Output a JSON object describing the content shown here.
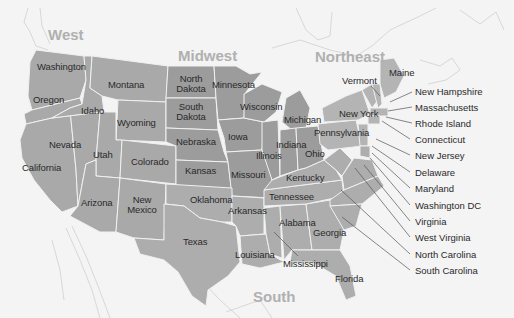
{
  "map": {
    "title": "United States regions and states",
    "colors": {
      "background": "#f4f4f4",
      "land_outline": "#c8c8c8",
      "west": "#a9a9a9",
      "midwest": "#9c9c9c",
      "northeast": "#b4b4b4",
      "south": "#adadad",
      "state_border": "#f0f0f0",
      "region_label": "#b0b0b0",
      "leader_line": "#555555",
      "text": "#2a2a2a"
    },
    "regions": [
      {
        "id": "west",
        "label": "West"
      },
      {
        "id": "midwest",
        "label": "Midwest"
      },
      {
        "id": "northeast",
        "label": "Northeast"
      },
      {
        "id": "south",
        "label": "South"
      }
    ],
    "states": {
      "washington": "Washington",
      "oregon": "Oregon",
      "california": "California",
      "idaho": "Idaho",
      "nevada": "Nevada",
      "montana": "Montana",
      "wyoming": "Wyoming",
      "utah": "Utah",
      "colorado": "Colorado",
      "arizona": "Arizona",
      "new_mexico_1": "New",
      "new_mexico_2": "Mexico",
      "north_dakota_1": "North",
      "north_dakota_2": "Dakota",
      "south_dakota_1": "South",
      "south_dakota_2": "Dakota",
      "nebraska": "Nebraska",
      "kansas": "Kansas",
      "minnesota": "Minnesota",
      "iowa": "Iowa",
      "missouri": "Missouri",
      "wisconsin": "Wisconsin",
      "illinois": "Illinois",
      "michigan": "Michigan",
      "indiana": "Indiana",
      "ohio": "Ohio",
      "kentucky": "Kentucky",
      "tennessee": "Tennessee",
      "oklahoma": "Oklahoma",
      "texas": "Texas",
      "arkansas": "Arkansas",
      "louisiana": "Louisiana",
      "mississippi": "Mississippi",
      "alabama": "Alabama",
      "georgia": "Georgia",
      "florida": "Florida",
      "pennsylvania": "Pennsylvania",
      "new_york": "New York",
      "vermont": "Vermont",
      "maine": "Maine"
    },
    "callouts": [
      {
        "id": "new-hampshire",
        "label": "New Hampshire"
      },
      {
        "id": "massachusetts",
        "label": "Massachusetts"
      },
      {
        "id": "rhode-island",
        "label": "Rhode Island"
      },
      {
        "id": "connecticut",
        "label": "Connecticut"
      },
      {
        "id": "new-jersey",
        "label": "New Jersey"
      },
      {
        "id": "delaware",
        "label": "Delaware"
      },
      {
        "id": "maryland",
        "label": "Maryland"
      },
      {
        "id": "washington-dc",
        "label": "Washington DC"
      },
      {
        "id": "virginia",
        "label": "Virginia"
      },
      {
        "id": "west-virginia",
        "label": "West Virginia"
      },
      {
        "id": "north-carolina",
        "label": "North Carolina"
      },
      {
        "id": "south-carolina",
        "label": "South Carolina"
      }
    ]
  }
}
